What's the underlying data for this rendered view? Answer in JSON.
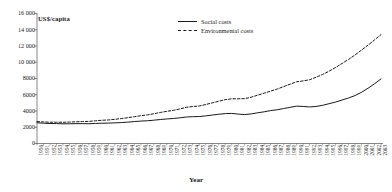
{
  "chart_data": {
    "type": "line",
    "title": "",
    "xlabel": "Year",
    "ylabel": "US$/capita",
    "ylim": [
      0,
      16000
    ],
    "yticks": [
      0,
      2000,
      4000,
      6000,
      8000,
      10000,
      12000,
      14000,
      16000
    ],
    "ytick_labels": [
      "0",
      "2000",
      "4000",
      "6000",
      "8000",
      "10 000",
      "12 000",
      "14 000",
      "16 000"
    ],
    "grid": false,
    "legend_position": "top-center",
    "x": [
      1950,
      1951,
      1952,
      1953,
      1954,
      1955,
      1956,
      1957,
      1958,
      1959,
      1960,
      1961,
      1962,
      1963,
      1964,
      1965,
      1966,
      1967,
      1968,
      1969,
      1970,
      1971,
      1972,
      1973,
      1974,
      1975,
      1976,
      1977,
      1978,
      1979,
      1980,
      1981,
      1982,
      1983,
      1984,
      1985,
      1986,
      1987,
      1988,
      1989,
      1990,
      1991,
      1992,
      1993,
      1994,
      1995,
      1996,
      1997,
      1998,
      1999,
      2000,
      2001,
      2002,
      2003
    ],
    "categories": [
      "1950",
      "1951",
      "1952",
      "1953",
      "1954",
      "1955",
      "1956",
      "1957",
      "1958",
      "1959",
      "1960",
      "1961",
      "1962",
      "1963",
      "1964",
      "1965",
      "1966",
      "1967",
      "1968",
      "1969",
      "1970",
      "1971",
      "1972",
      "1973",
      "1974",
      "1975",
      "1976",
      "1977",
      "1978",
      "1979",
      "1980",
      "1981",
      "1982",
      "1983",
      "1984",
      "1985",
      "1986",
      "1987",
      "1988",
      "1989",
      "1990",
      "1991",
      "1992",
      "1993",
      "1994",
      "1995",
      "1996",
      "1997",
      "1998",
      "1999",
      "2000",
      "2001",
      "2002",
      "2003"
    ],
    "series": [
      {
        "name": "Social costs",
        "style": "solid",
        "color": "#1a1a1a",
        "values": [
          2550,
          2500,
          2460,
          2450,
          2420,
          2430,
          2440,
          2450,
          2430,
          2470,
          2500,
          2510,
          2540,
          2580,
          2630,
          2700,
          2760,
          2800,
          2870,
          2950,
          3020,
          3080,
          3160,
          3260,
          3300,
          3320,
          3400,
          3500,
          3600,
          3680,
          3700,
          3620,
          3560,
          3640,
          3780,
          3900,
          4050,
          4150,
          4300,
          4450,
          4600,
          4560,
          4500,
          4560,
          4700,
          4900,
          5100,
          5350,
          5600,
          5900,
          6300,
          6800,
          7350,
          7950
        ]
      },
      {
        "name": "Environmental costs",
        "style": "dashed",
        "color": "#1a1a1a",
        "values": [
          2700,
          2650,
          2620,
          2620,
          2610,
          2640,
          2670,
          2700,
          2720,
          2790,
          2860,
          2900,
          2980,
          3070,
          3180,
          3300,
          3420,
          3520,
          3660,
          3820,
          3960,
          4080,
          4250,
          4450,
          4550,
          4620,
          4800,
          5000,
          5200,
          5400,
          5500,
          5500,
          5520,
          5700,
          5950,
          6200,
          6450,
          6700,
          7000,
          7300,
          7600,
          7700,
          7850,
          8150,
          8500,
          8900,
          9350,
          9850,
          10350,
          10900,
          11500,
          12100,
          12750,
          13400
        ]
      }
    ]
  }
}
